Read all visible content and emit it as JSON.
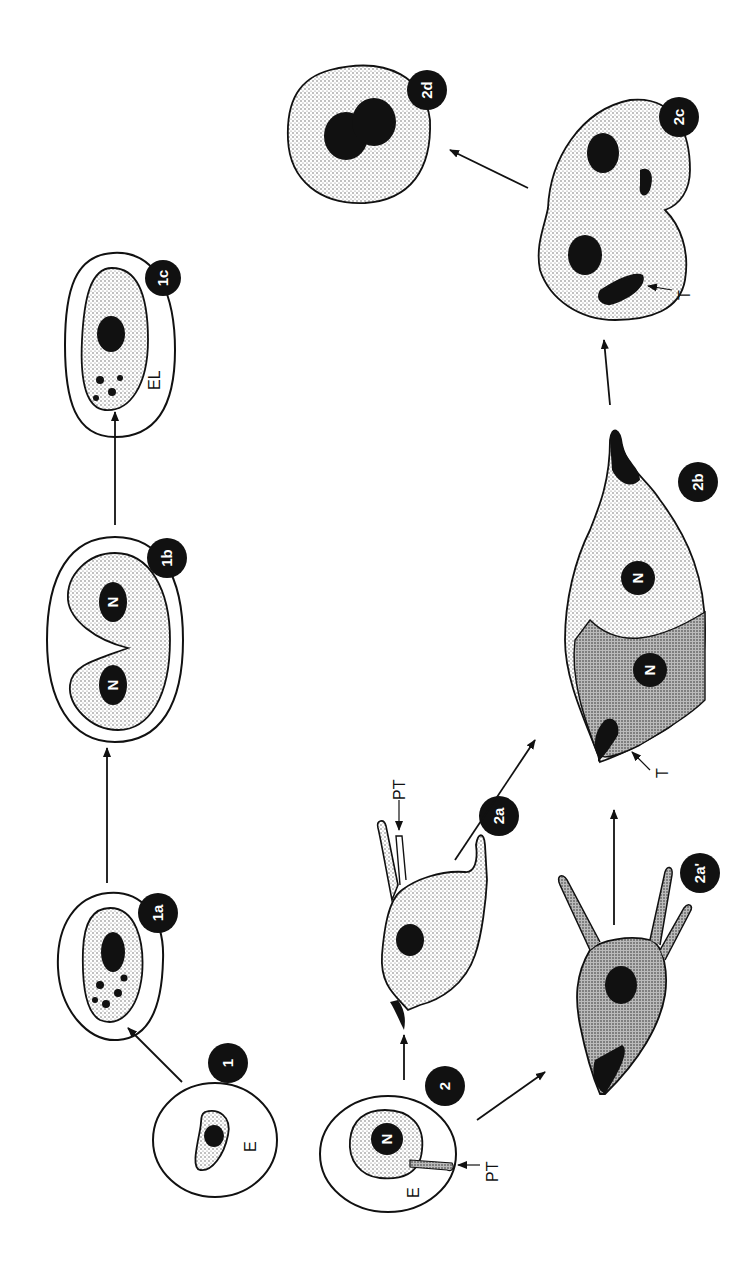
{
  "figure": {
    "type": "parasite life cycle diagram (rotated 90 degrees)",
    "colors": {
      "ink": "#111111",
      "stipple": "#cfcfcf",
      "stipple_dark": "#9a9a9a",
      "background": "#ffffff"
    }
  },
  "stages": {
    "s1": {
      "badge": "1",
      "label_E": "E"
    },
    "s1a": {
      "badge": "1a"
    },
    "s1b": {
      "badge": "1b",
      "nucleus_1": "N",
      "nucleus_2": "N"
    },
    "s1c": {
      "badge": "1c",
      "label_EL": "EL"
    },
    "s2": {
      "badge": "2",
      "nucleus": "N",
      "label_E": "E",
      "label_PT": "PT"
    },
    "s2a": {
      "badge": "2a",
      "label_PT": "PT"
    },
    "s2a_prime": {
      "badge": "2a'"
    },
    "s2b": {
      "badge": "2b",
      "nucleus_1": "N",
      "nucleus_2": "N",
      "label_T": "T"
    },
    "s2c": {
      "badge": "2c",
      "label_T": "T"
    },
    "s2d": {
      "badge": "2d"
    }
  },
  "arrows": [
    {
      "from": "1",
      "to": "1a"
    },
    {
      "from": "1a",
      "to": "1b"
    },
    {
      "from": "1b",
      "to": "1c"
    },
    {
      "from": "2",
      "to": "2a"
    },
    {
      "from": "2",
      "to": "2a'"
    },
    {
      "from": "2a",
      "to": "2b"
    },
    {
      "from": "2a'",
      "to": "2b"
    },
    {
      "from": "2b",
      "to": "2c"
    },
    {
      "from": "2c",
      "to": "2d"
    }
  ]
}
